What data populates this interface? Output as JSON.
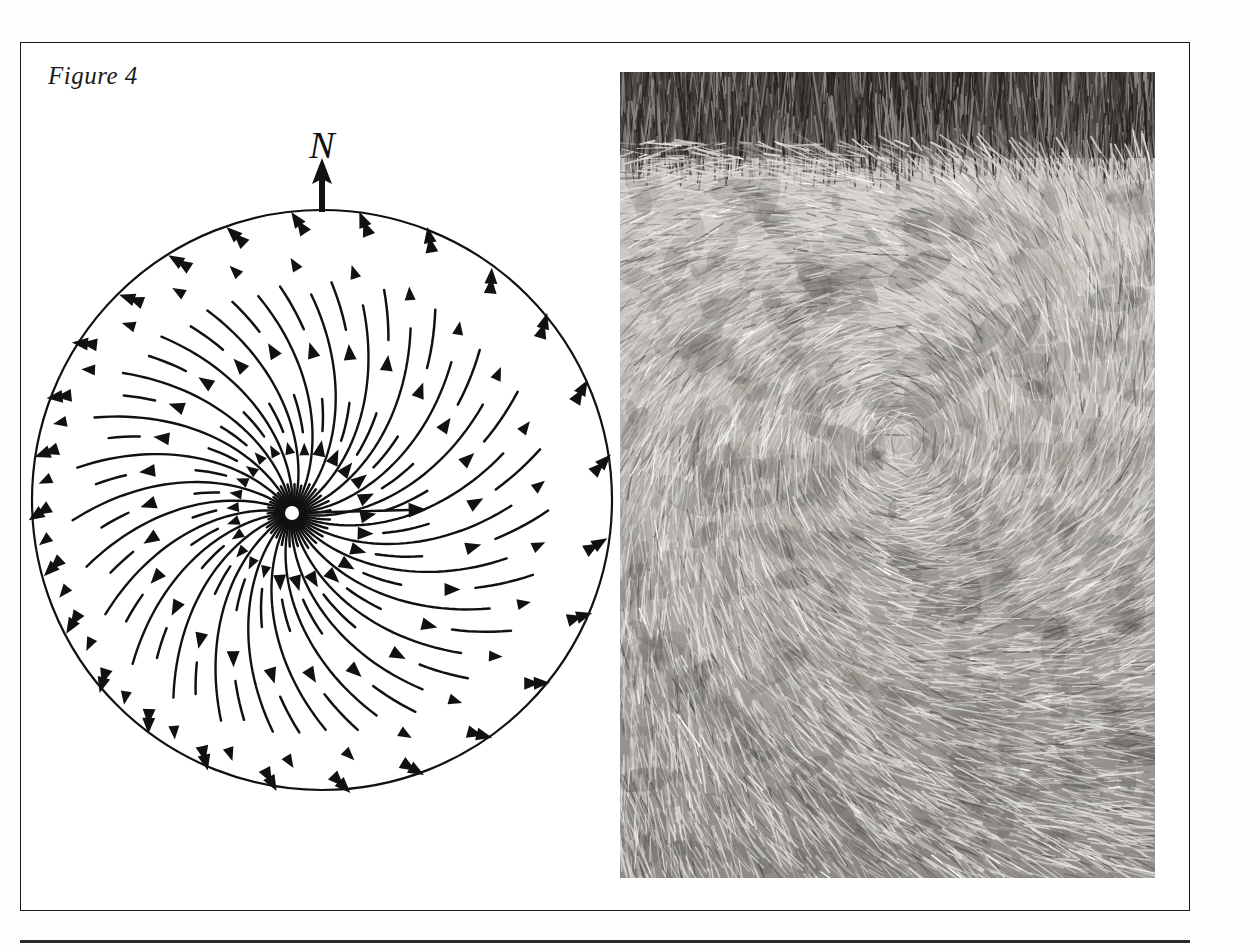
{
  "figure": {
    "caption": "Figure 4",
    "frame_color": "#1b1b1b",
    "background": "#ffffff"
  },
  "diagram": {
    "north_label": "N",
    "north_arrow_name": "north-arrow",
    "circle": {
      "center_x": 300,
      "center_y": 400,
      "radius": 290,
      "stroke": "#111111",
      "stroke_width": 2.2
    },
    "vortex_focus": {
      "x": 270,
      "y": 413
    },
    "straight_ray": {
      "from_x": 272,
      "from_y": 413,
      "to_x": 395,
      "to_y": 410
    },
    "spiral": {
      "direction": "counterclockwise",
      "arm_count": 26,
      "description": "Streamlines radiate from an off-centre focus and curve counter-clockwise out to the circle perimeter, each carrying filled triangular arrowheads pointing outward along the flow."
    },
    "ink_color": "#111111"
  },
  "photo": {
    "alt": "black and white photograph of flattened swirled crop with standing crop forming a dark band across the top",
    "standing_crop_band": "dark vertical stems across upper edge",
    "laid_crop": "bright radial swirled straw filling the frame",
    "tone_light": "#d8d6d2",
    "tone_mid": "#9b9892",
    "tone_dark": "#3a3733"
  }
}
